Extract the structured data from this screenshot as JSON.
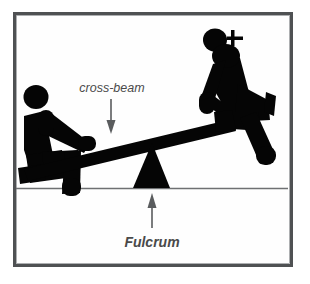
{
  "figure": {
    "background_color": "#fefefe",
    "frame_color": "#4f5153",
    "ink_color": "#050505",
    "line_color": "#6e7072",
    "label_color": "#4a4a4a"
  },
  "labels": {
    "crossbeam": "cross-beam",
    "fulcrum": "Fulcrum"
  },
  "annotations": {
    "crossbeam_arrow": "arrow-down",
    "fulcrum_arrow": "arrow-up"
  },
  "parts": {
    "ground_line": "ground-line",
    "beam": "cross-beam",
    "pivot": "fulcrum-triangle",
    "left_person": "seated-person-left",
    "right_person": "seated-person-right"
  }
}
